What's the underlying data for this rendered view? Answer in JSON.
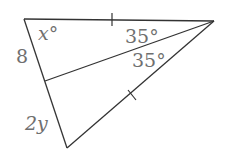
{
  "figure": {
    "type": "triangle-with-bisector",
    "stroke_color": "#333333",
    "label_color": "#6f6f6f",
    "labels": {
      "angle_top_left": "x°",
      "angle_upper": "35°",
      "angle_lower": "35°",
      "side_upper_left": "8",
      "side_lower_left": "2y"
    },
    "tick_marks": [
      "top-side",
      "right-lower-side"
    ]
  }
}
